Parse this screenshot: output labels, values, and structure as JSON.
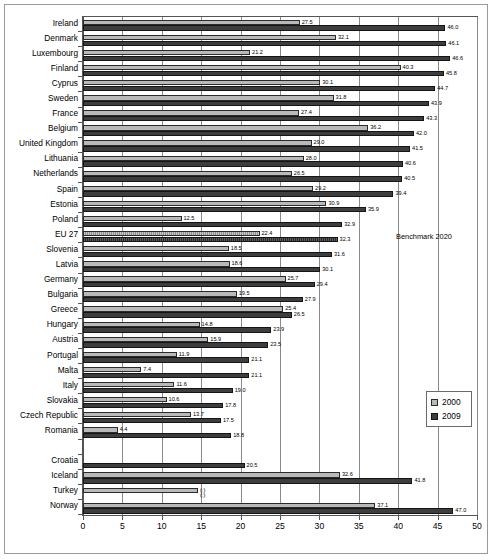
{
  "figure": {
    "benchmark_note": "Benchmark 2020",
    "legend": {
      "position": "bottom-right-inside",
      "entries": [
        {
          "label": "2000",
          "color": "#b9b9b9"
        },
        {
          "label": "2009",
          "color": "#3d3d3d"
        }
      ]
    }
  },
  "chart_data": {
    "type": "bar",
    "orientation": "horizontal",
    "title": "",
    "subtitle": "",
    "xlabel": "",
    "ylabel": "",
    "xlim": [
      0,
      50
    ],
    "xticks": [
      0,
      5,
      10,
      15,
      20,
      25,
      30,
      35,
      40,
      45,
      50
    ],
    "xtick_labels": [
      "0",
      "5",
      "10",
      "15",
      "20",
      "25",
      "30",
      "35",
      "40",
      "45",
      "50"
    ],
    "grid": "vertical",
    "annotations": [
      "Benchmark 2020"
    ],
    "legend_entries": [
      "2000",
      "2009"
    ],
    "missing_marker": "(:)",
    "categories": [
      "Ireland",
      "Denmark",
      "Luxembourg",
      "Finland",
      "Cyprus",
      "Sweden",
      "France",
      "Belgium",
      "United Kingdom",
      "Lithuania",
      "Netherlands",
      "Spain",
      "Estonia",
      "Poland",
      "EU 27",
      "Slovenia",
      "Latvia",
      "Germany",
      "Bulgaria",
      "Greece",
      "Hungary",
      "Austria",
      "Portugal",
      "Malta",
      "Italy",
      "Slovakia",
      "Czech Republic",
      "Romania",
      "",
      "Croatia",
      "Iceland",
      "Turkey",
      "Norway"
    ],
    "series": [
      {
        "name": "2000",
        "color": "#b9b9b9",
        "values": [
          27.5,
          32.1,
          21.2,
          40.3,
          30.1,
          31.8,
          27.4,
          36.2,
          29.0,
          28.0,
          26.5,
          29.2,
          30.9,
          12.5,
          22.4,
          18.5,
          18.6,
          25.7,
          19.5,
          25.4,
          14.8,
          15.9,
          11.9,
          7.4,
          11.6,
          10.6,
          13.7,
          4.4,
          null,
          null,
          32.6,
          14.6,
          37.1
        ],
        "labels": [
          "27.5",
          "32.1",
          "21.2",
          "40.3",
          "30.1",
          "31.8",
          "27.4",
          "36.2",
          "29.0",
          "28.0",
          "26.5",
          "29.2",
          "30.9",
          "12.5",
          "22.4",
          "18.5",
          "18.6",
          "25.7",
          "19.5",
          "25.4",
          "14.8",
          "15.9",
          "11.9",
          "7.4",
          "11.6",
          "10.6",
          "13.7",
          "4.4",
          "",
          "",
          "32.6",
          "(:)",
          "37.1"
        ]
      },
      {
        "name": "2009",
        "color": "#3d3d3d",
        "values": [
          46.0,
          46.1,
          46.6,
          45.8,
          44.7,
          43.9,
          43.3,
          42.0,
          41.5,
          40.6,
          40.5,
          39.4,
          35.9,
          32.9,
          32.3,
          31.6,
          30.1,
          29.4,
          27.9,
          26.5,
          23.9,
          23.5,
          21.1,
          21.1,
          19.0,
          17.8,
          17.5,
          18.8,
          null,
          20.5,
          41.8,
          null,
          47.0
        ],
        "labels": [
          "46.0",
          "46.1",
          "46.6",
          "45.8",
          "44.7",
          "43.9",
          "43.3",
          "42.0",
          "41.5",
          "40.6",
          "40.5",
          "39.4",
          "35.9",
          "32.9",
          "32.3",
          "31.6",
          "30.1",
          "29.4",
          "27.9",
          "26.5",
          "23.9",
          "23.5",
          "21.1",
          "21.1",
          "19.0",
          "17.8",
          "17.5",
          "18.8",
          "",
          "20.5",
          "41.8",
          "(:)",
          "47.0"
        ]
      }
    ]
  }
}
